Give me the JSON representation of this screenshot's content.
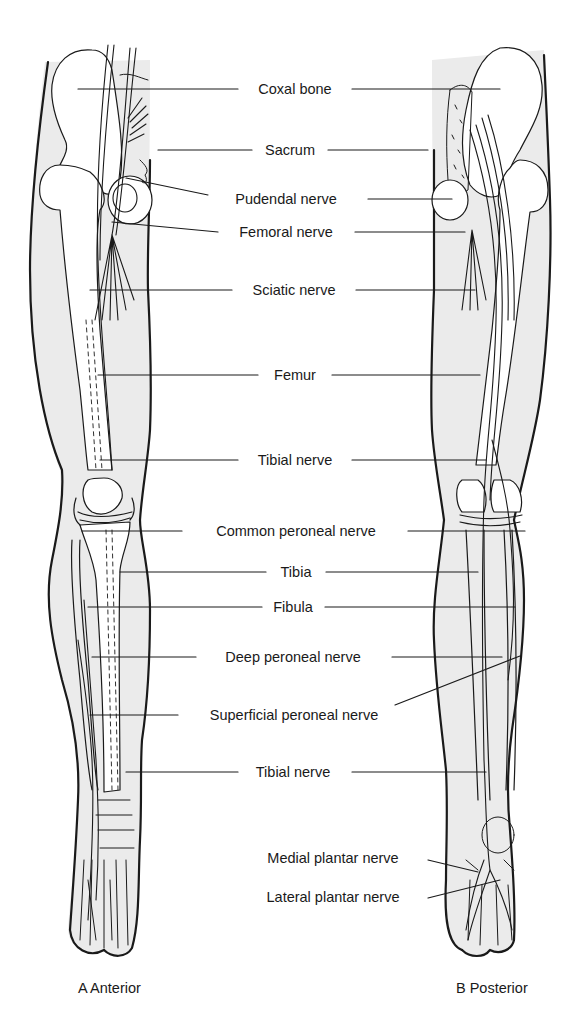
{
  "figure": {
    "type": "anatomical-diagram"
  },
  "views": [
    {
      "id": "anterior",
      "caption": "A Anterior"
    },
    {
      "id": "posterior",
      "caption": "B Posterior"
    }
  ],
  "labels": [
    {
      "text": "Coxal bone",
      "cx": 295,
      "cy": 89
    },
    {
      "text": "Sacrum",
      "cx": 290,
      "cy": 150
    },
    {
      "text": "Pudendal nerve",
      "cx": 286,
      "cy": 199
    },
    {
      "text": "Femoral nerve",
      "cx": 286,
      "cy": 232
    },
    {
      "text": "Sciatic nerve",
      "cx": 294,
      "cy": 290
    },
    {
      "text": "Femur",
      "cx": 295,
      "cy": 375
    },
    {
      "text": "Tibial nerve",
      "cx": 295,
      "cy": 460
    },
    {
      "text": "Common peroneal nerve",
      "cx": 296,
      "cy": 531
    },
    {
      "text": "Tibia",
      "cx": 296,
      "cy": 572
    },
    {
      "text": "Fibula",
      "cx": 293,
      "cy": 607
    },
    {
      "text": "Deep peroneal nerve",
      "cx": 293,
      "cy": 657
    },
    {
      "text": "Superficial peroneal nerve",
      "cx": 294,
      "cy": 715
    },
    {
      "text": "Tibial nerve",
      "cx": 293,
      "cy": 772
    },
    {
      "text": "Medial plantar nerve",
      "cx": 333,
      "cy": 858
    },
    {
      "text": "Lateral plantar nerve",
      "cx": 333,
      "cy": 897
    }
  ],
  "colors": {
    "line": "#1a1a1a",
    "skin_shade": "#e9e9e9",
    "background": "#ffffff"
  }
}
